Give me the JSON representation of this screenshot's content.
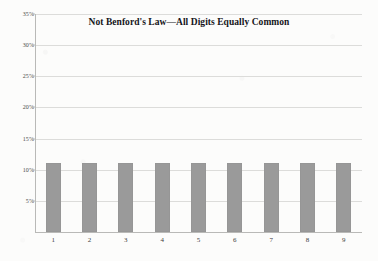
{
  "chart_data": {
    "type": "bar",
    "title": "Not Benford's Law—All Digits Equally Common",
    "xlabel": "",
    "ylabel": "",
    "categories": [
      "1",
      "2",
      "3",
      "4",
      "5",
      "6",
      "7",
      "8",
      "9"
    ],
    "values": [
      11.1,
      11.1,
      11.1,
      11.1,
      11.1,
      11.1,
      11.1,
      11.1,
      11.1
    ],
    "ylim": [
      0,
      35
    ],
    "ytick_values": [
      35,
      30,
      25,
      20,
      15,
      10,
      5
    ],
    "ytick_labels": [
      "35%",
      "30%",
      "25%",
      "20%",
      "15%",
      "10%",
      "5%"
    ],
    "grid": true,
    "legend": false,
    "legend_position": "none",
    "series": [
      {
        "name": "Digit frequency",
        "values": [
          11.1,
          11.1,
          11.1,
          11.1,
          11.1,
          11.1,
          11.1,
          11.1,
          11.1
        ]
      }
    ],
    "bar_color": "#9a9a9a",
    "grid_color": "#dcdcda",
    "axis_color": "#b9b9b7",
    "background_color": "#fcfcfb"
  }
}
